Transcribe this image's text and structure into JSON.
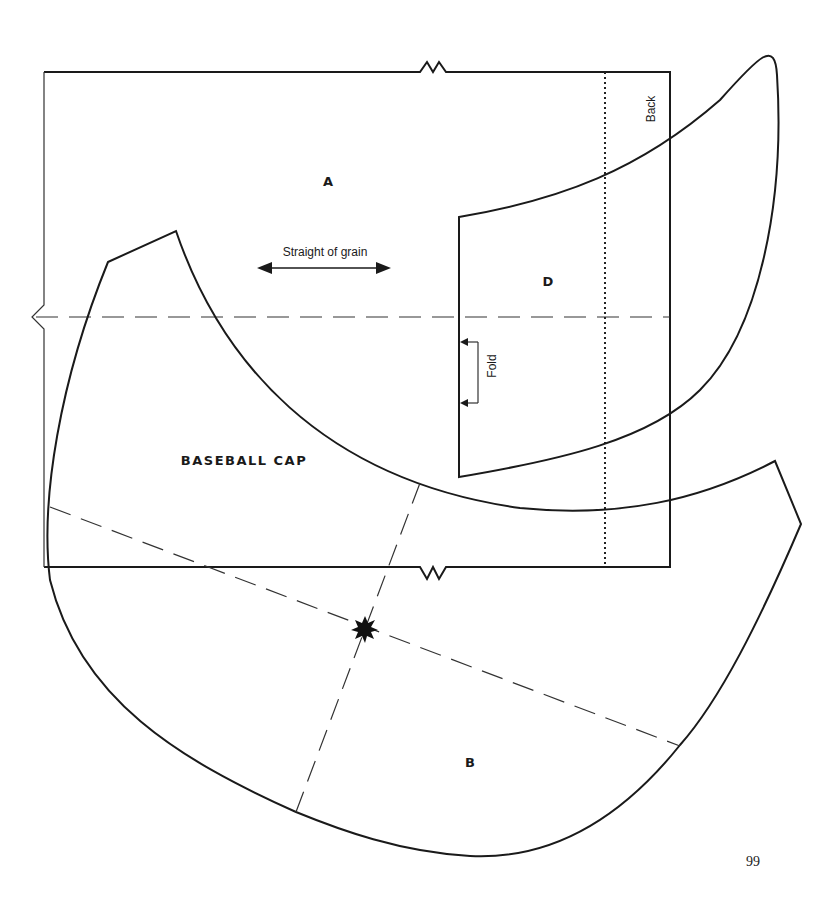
{
  "title": "BASEBALL CAP",
  "pieces": {
    "a": {
      "label": "A"
    },
    "b": {
      "label": "B"
    },
    "d": {
      "label": "D"
    }
  },
  "annotations": {
    "grain": "Straight of grain",
    "fold": "Fold",
    "back": "Back"
  },
  "page_number": "99"
}
